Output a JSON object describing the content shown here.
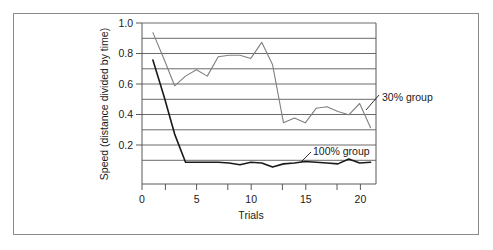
{
  "chart_data": {
    "type": "line",
    "title": "",
    "xlabel": "Trials",
    "ylabel": "Speed (distance divided by time)",
    "xlim": [
      0,
      21.5
    ],
    "ylim": [
      0.0,
      1.0
    ],
    "xticks": [
      0,
      5,
      10,
      15,
      20
    ],
    "xtick_labels": [
      "0",
      "5",
      "10",
      "15",
      "20"
    ],
    "yticks": [
      0.2,
      0.4,
      0.6,
      0.8,
      1.0
    ],
    "ytick_labels": [
      "0.2",
      "0.4",
      "0.6",
      "0.8",
      "1.0"
    ],
    "gridlines_y": [
      0.1,
      0.2,
      0.3,
      0.4,
      0.5,
      0.6,
      0.7,
      0.8,
      0.9,
      1.0
    ],
    "grid": true,
    "legend_position": "inline-annotation",
    "x": [
      1,
      2,
      3,
      4,
      5,
      6,
      7,
      8,
      9,
      10,
      11,
      12,
      13,
      14,
      15,
      16,
      17,
      18,
      19,
      20,
      21
    ],
    "series": [
      {
        "name": "30% group",
        "color": "#808080",
        "line_width": 1.1,
        "values": [
          0.94,
          0.78,
          0.61,
          0.67,
          0.71,
          0.67,
          0.79,
          0.8,
          0.8,
          0.78,
          0.88,
          0.74,
          0.38,
          0.41,
          0.38,
          0.47,
          0.48,
          0.45,
          0.43,
          0.5,
          0.35
        ],
        "label_text": "30% group",
        "label_x": 382,
        "label_y": 100
      },
      {
        "name": "100% group",
        "color": "#1a1a1a",
        "line_width": 1.6,
        "values": [
          0.77,
          0.55,
          0.31,
          0.135,
          0.135,
          0.135,
          0.135,
          0.13,
          0.12,
          0.135,
          0.13,
          0.105,
          0.125,
          0.13,
          0.14,
          0.135,
          0.13,
          0.125,
          0.155,
          0.13,
          0.135
        ],
        "label_text": "100% group",
        "label_x": 312,
        "label_y": 155
      }
    ]
  },
  "axes": {
    "y_axis_title": "Speed (distance divided by time)",
    "x_axis_title": "Trials"
  },
  "annotations": {
    "thirty_group": "30% group",
    "hundred_group": "100% group"
  }
}
